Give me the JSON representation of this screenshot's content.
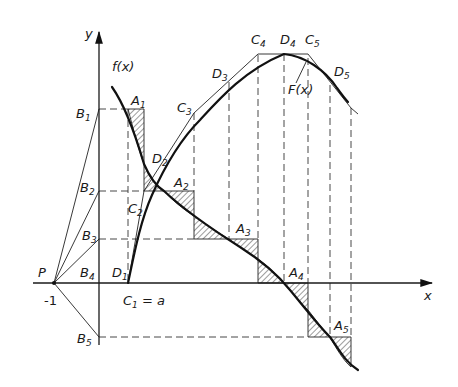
{
  "figure": {
    "axes": {
      "x_label": "x",
      "y_label": "y",
      "pole_label": "P",
      "pole_value": "-1"
    },
    "curves": {
      "f_label": "f(x)",
      "F_label": "F(x)"
    },
    "points": {
      "B": [
        "B",
        "B",
        "B",
        "B",
        "B"
      ],
      "B_sub": [
        "1",
        "2",
        "3",
        "4",
        "5"
      ],
      "A": [
        "A",
        "A",
        "A",
        "A",
        "A"
      ],
      "A_sub": [
        "1",
        "2",
        "3",
        "4",
        "5"
      ],
      "C": [
        "C",
        "C",
        "C",
        "C",
        "C"
      ],
      "C_sub": [
        "1",
        "2",
        "3",
        "4",
        "5"
      ],
      "D": [
        "D",
        "D",
        "D",
        "D",
        "D"
      ],
      "D_sub": [
        "1",
        "2",
        "3",
        "4",
        "5"
      ],
      "C1_suffix": " = a"
    }
  }
}
